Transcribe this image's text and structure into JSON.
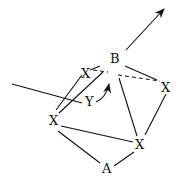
{
  "diagram": {
    "type": "geometric-network",
    "colors": {
      "ink": "#111111",
      "background": "#ffffff"
    },
    "nodes": [
      {
        "id": "B",
        "label": "B",
        "x": 115,
        "y": 62
      },
      {
        "id": "X1",
        "label": "X",
        "x": 86,
        "y": 77
      },
      {
        "id": "X2",
        "label": "X",
        "x": 167,
        "y": 91
      },
      {
        "id": "Y",
        "label": "Y",
        "x": 90,
        "y": 105
      },
      {
        "id": "X3",
        "label": "X",
        "x": 54,
        "y": 124
      },
      {
        "id": "X4",
        "label": "X",
        "x": 141,
        "y": 148
      },
      {
        "id": "A",
        "label": "A",
        "x": 107,
        "y": 172
      }
    ],
    "labels": {
      "b": "B",
      "x_top_left": "X",
      "x_right": "X",
      "y": "Y",
      "x_left": "X",
      "x_bottom_right": "X",
      "a": "A"
    },
    "edges": [
      {
        "from": "X1",
        "to": "B",
        "style": "dashed"
      },
      {
        "from": "B",
        "to": "X2",
        "style": "dashed"
      },
      {
        "from": "B",
        "to": "X2",
        "style": "solid"
      },
      {
        "from": "B",
        "to": "X4",
        "style": "solid"
      },
      {
        "from": "X2",
        "to": "X4",
        "style": "solid"
      },
      {
        "from": "X3",
        "to": "X4",
        "style": "solid"
      },
      {
        "from": "X3",
        "to": "A",
        "style": "solid"
      },
      {
        "from": "X4",
        "to": "A",
        "style": "solid"
      },
      {
        "from": "X3",
        "to": "X1",
        "style": "solid"
      },
      {
        "from": "X3",
        "to": "B",
        "style": "solid"
      },
      {
        "from": "external-left",
        "to": "Y",
        "style": "solid"
      }
    ],
    "arrows": [
      {
        "from": "B",
        "direction": "up-right",
        "style": "straight"
      },
      {
        "from": "Y",
        "to": "B",
        "style": "curved"
      }
    ]
  }
}
